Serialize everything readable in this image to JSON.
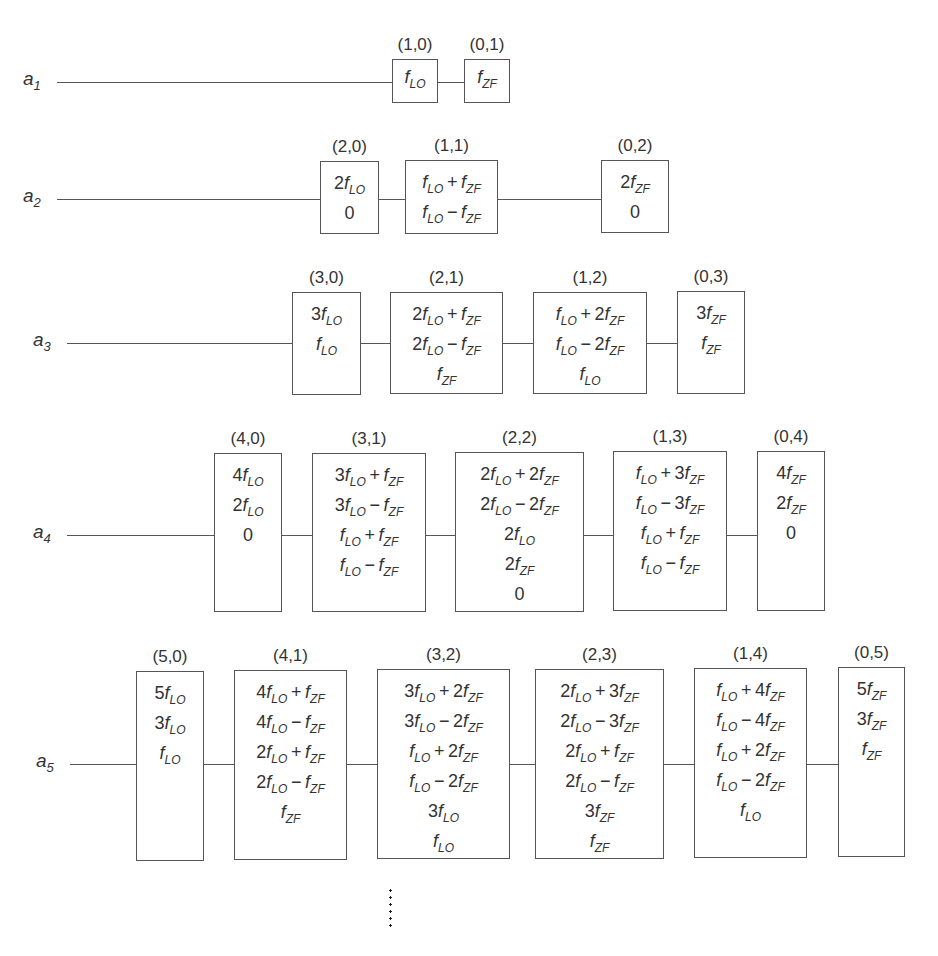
{
  "diagram": {
    "type": "mixer-intermodulation-products",
    "rows": [
      {
        "label": "a",
        "index": "1",
        "line": {
          "x1": 57,
          "y": 82
        },
        "boxes": [
          {
            "coeff": "(1,0)",
            "x": 392,
            "y": 59,
            "w": 46,
            "h": 44,
            "terms": [
              "f_LO"
            ]
          },
          {
            "coeff": "(0,1)",
            "x": 464,
            "y": 59,
            "w": 46,
            "h": 44,
            "terms": [
              "f_ZF"
            ]
          }
        ]
      },
      {
        "label": "a",
        "index": "2",
        "line": {
          "x1": 57,
          "y": 199
        },
        "boxes": [
          {
            "coeff": "(2,0)",
            "x": 320,
            "y": 161,
            "w": 59,
            "h": 73,
            "terms": [
              "2f_LO",
              "0"
            ]
          },
          {
            "coeff": "(1,1)",
            "x": 405,
            "y": 160,
            "w": 93,
            "h": 74,
            "terms": [
              "f_LO+f_ZF",
              "f_LO−f_ZF"
            ]
          },
          {
            "coeff": "(0,2)",
            "x": 601,
            "y": 160,
            "w": 68,
            "h": 73,
            "terms": [
              "2f_ZF",
              "0"
            ]
          }
        ]
      },
      {
        "label": "a",
        "index": "3",
        "line": {
          "x1": 67,
          "y": 343
        },
        "boxes": [
          {
            "coeff": "(3,0)",
            "x": 292,
            "y": 292,
            "w": 69,
            "h": 103,
            "terms": [
              "3f_LO",
              "f_LO"
            ]
          },
          {
            "coeff": "(2,1)",
            "x": 390,
            "y": 292,
            "w": 113,
            "h": 102,
            "terms": [
              "2f_LO+f_ZF",
              "2f_LO−f_ZF",
              "f_ZF"
            ]
          },
          {
            "coeff": "(1,2)",
            "x": 533,
            "y": 292,
            "w": 114,
            "h": 102,
            "terms": [
              "f_LO+2f_ZF",
              "f_LO−2f_ZF",
              "f_LO"
            ]
          },
          {
            "coeff": "(0,3)",
            "x": 677,
            "y": 291,
            "w": 68,
            "h": 103,
            "terms": [
              "3f_ZF",
              "f_ZF"
            ]
          }
        ]
      },
      {
        "label": "a",
        "index": "4",
        "line": {
          "x1": 67,
          "y": 535
        },
        "boxes": [
          {
            "coeff": "(4,0)",
            "x": 214,
            "y": 453,
            "w": 68,
            "h": 159,
            "terms": [
              "4f_LO",
              "2f_LO",
              "0"
            ]
          },
          {
            "coeff": "(3,1)",
            "x": 312,
            "y": 453,
            "w": 114,
            "h": 159,
            "terms": [
              "3f_LO+f_ZF",
              "3f_LO−f_ZF",
              "f_LO+f_ZF",
              "f_LO−f_ZF"
            ]
          },
          {
            "coeff": "(2,2)",
            "x": 455,
            "y": 452,
            "w": 129,
            "h": 160,
            "terms": [
              "2f_LO+2f_ZF",
              "2f_LO−2f_ZF",
              "2f_LO",
              "2f_ZF",
              "0"
            ]
          },
          {
            "coeff": "(1,3)",
            "x": 613,
            "y": 451,
            "w": 114,
            "h": 160,
            "terms": [
              "f_LO+3f_ZF",
              "f_LO−3f_ZF",
              "f_LO+f_ZF",
              "f_LO−f_ZF"
            ]
          },
          {
            "coeff": "(0,4)",
            "x": 757,
            "y": 451,
            "w": 68,
            "h": 160,
            "terms": [
              "4f_ZF",
              "2f_ZF",
              "0"
            ]
          }
        ]
      },
      {
        "label": "a",
        "index": "5",
        "line": {
          "x1": 70,
          "y": 764
        },
        "boxes": [
          {
            "coeff": "(5,0)",
            "x": 136,
            "y": 671,
            "w": 68,
            "h": 190,
            "terms": [
              "5f_LO",
              "3f_LO",
              "f_LO"
            ]
          },
          {
            "coeff": "(4,1)",
            "x": 234,
            "y": 670,
            "w": 113,
            "h": 190,
            "terms": [
              "4f_LO+f_ZF",
              "4f_LO−f_ZF",
              "2f_LO+f_ZF",
              "2f_LO−f_ZF",
              "f_ZF"
            ]
          },
          {
            "coeff": "(3,2)",
            "x": 377,
            "y": 669,
            "w": 133,
            "h": 190,
            "terms": [
              "3f_LO+2f_ZF",
              "3f_LO−2f_ZF",
              "f_LO+2f_ZF",
              "f_LO−2f_ZF",
              "3f_LO",
              "f_LO"
            ]
          },
          {
            "coeff": "(2,3)",
            "x": 535,
            "y": 669,
            "w": 129,
            "h": 190,
            "terms": [
              "2f_LO+3f_ZF",
              "2f_LO−3f_ZF",
              "2f_LO+f_ZF",
              "2f_LO−f_ZF",
              "3f_ZF",
              "f_ZF"
            ]
          },
          {
            "coeff": "(1,4)",
            "x": 694,
            "y": 668,
            "w": 113,
            "h": 190,
            "terms": [
              "f_LO+4f_ZF",
              "f_LO−4f_ZF",
              "f_LO+2f_ZF",
              "f_LO−2f_ZF",
              "f_LO"
            ]
          },
          {
            "coeff": "(0,5)",
            "x": 838,
            "y": 667,
            "w": 67,
            "h": 190,
            "terms": [
              "5f_ZF",
              "3f_ZF",
              "f_ZF"
            ]
          }
        ]
      }
    ],
    "continuation": "⋮",
    "caption_partial": "Abb. 27.13 Frequenzen ... (cut off)"
  }
}
